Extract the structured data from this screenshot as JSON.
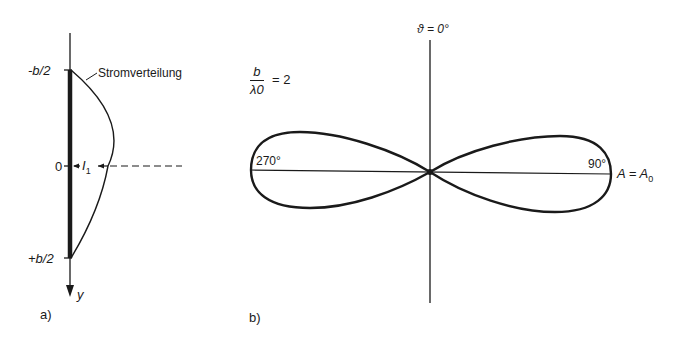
{
  "panel_a": {
    "caption": "a)",
    "label_top": "-b/2",
    "label_zero": "0",
    "label_bottom": "+b/2",
    "axis_label": "y",
    "current_label": "I",
    "current_subscript": "1",
    "distribution_label": "Stromverteilung"
  },
  "panel_b": {
    "caption": "b)",
    "ratio_numerator": "b",
    "ratio_denominator": "λ0",
    "ratio_value": "= 2",
    "top_angle_label": "ϑ = 0°",
    "left_angle_label": "270°",
    "right_angle_label": "90°",
    "amplitude_label": "A = A",
    "amplitude_subscript": "0"
  },
  "colors": {
    "ink": "#1a1a1a",
    "background": "#ffffff"
  }
}
